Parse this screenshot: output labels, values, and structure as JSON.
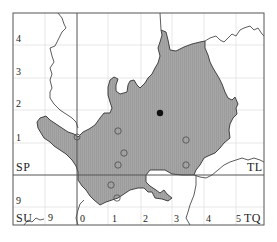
{
  "map": {
    "type": "distribution-map",
    "grid_squares": {
      "top_left": "SP",
      "top_right": "TL",
      "bottom_left": "SU",
      "bottom_right": "TQ"
    },
    "left_axis_labels": [
      "4",
      "3",
      "2",
      "1",
      "9"
    ],
    "bottom_axis_labels": [
      "9",
      "0",
      "1",
      "2",
      "3",
      "4",
      "5"
    ],
    "colors": {
      "county_fill": "#a9a9a9",
      "border": "#333333",
      "grid_major": "#555555",
      "grid_minor": "#dddddd",
      "marker_filled": "#111111",
      "marker_open": "#555555"
    },
    "markers": {
      "filled": [
        {
          "x": 160,
          "y": 113
        }
      ],
      "open": [
        {
          "x": 118,
          "y": 131
        },
        {
          "x": 124,
          "y": 153
        },
        {
          "x": 118,
          "y": 165
        },
        {
          "x": 186,
          "y": 140
        },
        {
          "x": 186,
          "y": 165
        },
        {
          "x": 111,
          "y": 185
        },
        {
          "x": 117,
          "y": 198
        }
      ]
    }
  }
}
